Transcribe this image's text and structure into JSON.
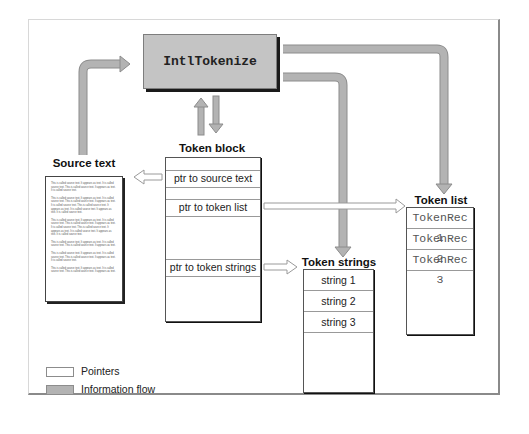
{
  "diagram": {
    "function_box": {
      "label": "IntlTokenize"
    },
    "source_text": {
      "title": "Source text",
      "paragraphs": [
        "This is called source text. It appears as text. It is called source text. This is called source text. It appears as text. It is called source text.",
        "This is called source text. It appears as text. It is called source text. This is called source text. It appears as text. It is called source text. This is called source text. It appears as text. It is called source text. It appears as text. It is called source text.",
        "This is called source text. It appears as text. It is called source text. This is called source text. It appears as text. It is called source text. This is called source text. It appears as text. It is called source text. It appears as text. It is called source text.",
        "This is called source text. It appears as text. It is called source text. This is called source text. It appears as text.",
        "This is called source text. It appears as text. It is called source text. This is called source text. It appears as text. It is called source text.",
        "This is called source text. It appears as text. It is called source text. This is called source text. It appears as text."
      ]
    },
    "token_block": {
      "title": "Token block",
      "rows": [
        {
          "label": "ptr to source text"
        },
        {
          "label": "ptr to token list"
        },
        {
          "label": "ptr to token strings"
        }
      ]
    },
    "token_strings": {
      "title": "Token strings",
      "items": [
        "string 1",
        "string 2",
        "string 3"
      ]
    },
    "token_list": {
      "title": "Token list",
      "items": [
        "TokenRec 1",
        "TokenRec 2",
        "TokenRec 3"
      ]
    },
    "legend": {
      "pointers_label": "Pointers",
      "flow_label": "Information flow"
    },
    "colors": {
      "flow_fill": "#b3b3b3",
      "flow_stroke": "#8c8c8c",
      "pointer_fill": "#ffffff",
      "pointer_stroke": "#9a9a9a",
      "function_box_fill": "#c4c4c4"
    }
  }
}
